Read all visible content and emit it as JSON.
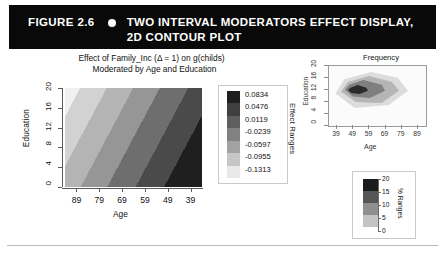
{
  "banner": {
    "figure_number": "FIGURE 2.6",
    "bullet": "bullet-dot",
    "title_line1": "TWO INTERVAL MODERATORS EFFECT DISPLAY,",
    "title_line2": "2D CONTOUR PLOT"
  },
  "main": {
    "title_line1": "Effect of Family_Inc (Δ = 1) on g(childs)",
    "title_line2": "Moderated by Age and Education",
    "xlabel": "Age",
    "ylabel": "Education",
    "key_title": "Effect Ranges"
  },
  "freq": {
    "title": "Frequency",
    "xlabel": "Age",
    "ylabel": "Education",
    "key_title": "% Ranges"
  },
  "colors": {
    "banner_bg": "#090909",
    "banner_fg": "#ffffff",
    "page_bg": "#ffffff",
    "axis": "#5a5a5a",
    "text": "#111111"
  },
  "chart_data": {
    "type": "heatmap",
    "title": "Effect of Family_Inc (Δ = 1) on g(childs) Moderated by Age and Education",
    "xlabel": "Age",
    "ylabel": "Education",
    "xticks": [
      "89",
      "79",
      "69",
      "59",
      "49",
      "39"
    ],
    "yticks": [
      "0",
      "4",
      "8",
      "12",
      "16",
      "20"
    ],
    "xlim": [
      89,
      39
    ],
    "ylim": [
      0,
      20
    ],
    "grid": false,
    "legend_position": "right",
    "legend_title": "Effect Ranges",
    "colorbar_levels": [
      {
        "label": "0.0834",
        "value": 0.0834,
        "color": "#1f1f1f"
      },
      {
        "label": "0.0476",
        "value": 0.0476,
        "color": "#3f3f3f"
      },
      {
        "label": "0.0119",
        "value": 0.0119,
        "color": "#5f5f5f"
      },
      {
        "label": "-0.0239",
        "value": -0.0239,
        "color": "#818181"
      },
      {
        "label": "-0.0597",
        "value": -0.0597,
        "color": "#a2a2a2"
      },
      {
        "label": "-0.0955",
        "value": -0.0955,
        "color": "#c6c6c6"
      },
      {
        "label": "-0.1313",
        "value": -0.1313,
        "color": "#e9e9e9"
      }
    ],
    "band_description": "Diagonal grayscale contour bands; lightest (most negative effect) at lower-left (high Age / low Education), darkest (most positive effect) at upper-right (low Age / high Education).",
    "panels": [
      {
        "type": "contour",
        "title": "Frequency",
        "xlabel": "Age",
        "ylabel": "Education",
        "xticks": [
          "39",
          "49",
          "59",
          "69",
          "79",
          "89"
        ],
        "yticks": [
          "0",
          "4",
          "8",
          "12",
          "16",
          "20"
        ],
        "xlim": [
          39,
          89
        ],
        "ylim": [
          0,
          20
        ],
        "legend_title": "% Ranges",
        "legend_ticks": [
          "0",
          "5",
          "10",
          "15",
          "20"
        ],
        "legend_levels": [
          {
            "label": "20",
            "value": 20,
            "color": "#1c1c1c"
          },
          {
            "label": "15",
            "value": 15,
            "color": "#565656"
          },
          {
            "label": "10",
            "value": 10,
            "color": "#8f8f8f"
          },
          {
            "label": "5",
            "value": 5,
            "color": "#c4c4c4"
          },
          {
            "label": "0",
            "value": 0,
            "color": "#f2f2f2"
          }
        ],
        "density_peak": {
          "age": 46,
          "education": 12,
          "pct": 20
        }
      }
    ]
  }
}
